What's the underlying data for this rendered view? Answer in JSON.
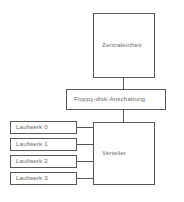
{
  "diagram": {
    "language": "de",
    "canvas": {
      "width": 184,
      "height": 202
    },
    "colors": {
      "background": "#ffffff",
      "stroke": "#58585a",
      "text": "#6a6a6c"
    },
    "nodes": {
      "zentraleinheit": {
        "label": "Zentraleinheit"
      },
      "anschaltung": {
        "label": "Floppy-disk-Anschaltung"
      },
      "verteiler": {
        "label": "Verteiler"
      },
      "drives": [
        {
          "label": "Laufwerk 0"
        },
        {
          "label": "Laufwerk 1"
        },
        {
          "label": "Laufwerk 2"
        },
        {
          "label": "Laufwerk 3"
        }
      ]
    }
  }
}
